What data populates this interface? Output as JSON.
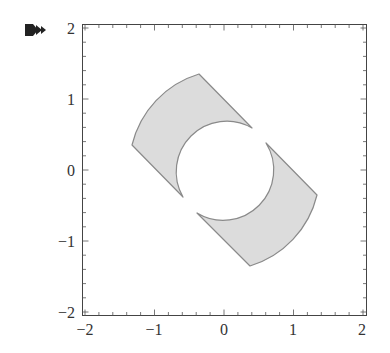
{
  "cell": {
    "output_marker_icon": "double-arrow-output-icon"
  },
  "chart_data": {
    "type": "region",
    "title": "",
    "xlabel": "",
    "ylabel": "",
    "xlim": [
      -2,
      2
    ],
    "ylim": [
      -2,
      2
    ],
    "frame": true,
    "grid": false,
    "x_ticks": [
      -2,
      -1,
      0,
      1,
      2
    ],
    "y_ticks": [
      -2,
      -1,
      0,
      1,
      2
    ],
    "x_tick_labels": [
      "−2",
      "−1",
      "0",
      "1",
      "2"
    ],
    "y_tick_labels": [
      "−2",
      "−1",
      "0",
      "1",
      "2"
    ],
    "minor_tick_step": 0.2,
    "regions": [
      {
        "name": "upper-left piece",
        "inner_radius": 0.71,
        "outer_radius": 1.4,
        "vertices": [
          [
            -0.36,
            1.35
          ],
          [
            -1.32,
            0.35
          ],
          [
            -0.59,
            -0.38
          ],
          [
            0.4,
            0.59
          ]
        ]
      },
      {
        "name": "lower-right piece",
        "inner_radius": 0.71,
        "outer_radius": 1.4,
        "vertices": [
          [
            0.36,
            -1.35
          ],
          [
            1.32,
            -0.35
          ],
          [
            0.59,
            0.38
          ],
          [
            -0.4,
            -0.59
          ]
        ]
      }
    ],
    "colors": {
      "fill": "#dcdcdc",
      "stroke": "#8a8a8a",
      "frame": "#444444"
    }
  }
}
